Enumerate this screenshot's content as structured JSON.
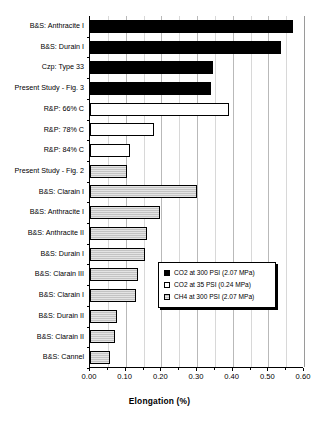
{
  "chart_data": {
    "type": "bar",
    "orientation": "horizontal",
    "title": "",
    "xlabel": "Elongation (%)",
    "ylabel": "",
    "xlim": [
      0.0,
      0.6
    ],
    "xticks": [
      "0.00",
      "0.10",
      "0.20",
      "0.30",
      "0.40",
      "0.50",
      "0.60"
    ],
    "xtick_values": [
      0.0,
      0.1,
      0.2,
      0.3,
      0.4,
      0.5,
      0.6
    ],
    "minor_ticks": true,
    "grid": "vertical",
    "legend_position": "center-right-inside",
    "categories": [
      "B&S: Anthracite I",
      "B&S: Durain I",
      "Czp: Type 33",
      "Present Study - Fig. 3",
      "R&P: 66% C",
      "R&P: 78% C",
      "R&P: 84% C",
      "Present Study - Fig. 2",
      "B&S: Clarain I",
      "B&S: Anthracite I",
      "B&S: Anthracite II",
      "B&S: Durain I",
      "B&S: Clarain III",
      "B&S: Clarain I",
      "B&S: Durain II",
      "B&S: Clarain II",
      "B&S: Cannel"
    ],
    "values": [
      0.57,
      0.535,
      0.345,
      0.34,
      0.39,
      0.18,
      0.112,
      0.105,
      0.3,
      0.195,
      0.16,
      0.155,
      0.135,
      0.13,
      0.076,
      0.07,
      0.057
    ],
    "series_of_bar": [
      1,
      1,
      1,
      1,
      2,
      2,
      2,
      3,
      3,
      3,
      3,
      3,
      3,
      3,
      3,
      3,
      3
    ],
    "series": [
      {
        "key": 1,
        "name": "CO2 at 300 PSI (2.07 MPa)",
        "color": "#000000"
      },
      {
        "key": 2,
        "name": "CO2 at 35 PSI (0.24 MPa)",
        "color": "#ffffff"
      },
      {
        "key": 3,
        "name": "CH4 at 300 PSI (2.07 MPa)",
        "color": "#c3c3c3"
      }
    ]
  },
  "legend": {
    "items": [
      "CO2 at 300 PSI (2.07 MPa)",
      "CO2 at 35 PSI (0.24 MPa)",
      "CH4 at 300 PSI (2.07 MPa)"
    ]
  }
}
